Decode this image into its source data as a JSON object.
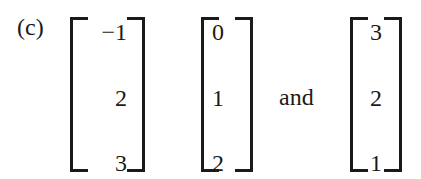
{
  "problem": {
    "label": "(c)",
    "conjunction": "and",
    "vectors": [
      {
        "entries": [
          "−1",
          "2",
          "3"
        ]
      },
      {
        "entries": [
          "0",
          "1",
          "2"
        ]
      },
      {
        "entries": [
          "3",
          "2",
          "1"
        ]
      }
    ]
  }
}
